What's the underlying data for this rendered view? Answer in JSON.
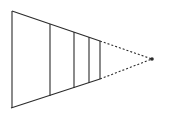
{
  "figure": {
    "kind": "perspective-line-drawing",
    "width": 169,
    "height": 115,
    "background_color": "#ffffff",
    "stroke_color": "#2b2b2b",
    "stroke_width": 1.1,
    "dash_pattern": "2,2"
  },
  "geometry": {
    "vanishing_point": {
      "x": 152,
      "y": 59,
      "dot_radius": 1.8
    },
    "top_edge": {
      "x1": 12,
      "y1": 11,
      "x2": 100,
      "y2": 41,
      "style": "solid"
    },
    "bottom_edge": {
      "x1": 11,
      "y1": 108,
      "x2": 100,
      "y2": 79,
      "style": "solid"
    },
    "top_edge_dashed": {
      "x1": 100,
      "y1": 41,
      "x2": 152,
      "y2": 59,
      "style": "dashed"
    },
    "bottom_edge_dashed": {
      "x1": 100,
      "y1": 79,
      "x2": 152,
      "y2": 59,
      "style": "dashed"
    },
    "verticals": [
      {
        "name": "front-face-edge",
        "x": 12,
        "y_top": 11,
        "y_bottom": 108,
        "style": "solid"
      },
      {
        "name": "rib-1",
        "x": 50,
        "y_top": 24,
        "y_bottom": 96,
        "style": "solid"
      },
      {
        "name": "rib-2",
        "x": 74,
        "y_top": 32,
        "y_bottom": 88,
        "style": "solid"
      },
      {
        "name": "rib-3",
        "x": 89,
        "y_top": 37,
        "y_bottom": 83,
        "style": "solid"
      },
      {
        "name": "rib-4",
        "x": 100,
        "y_top": 41,
        "y_bottom": 79,
        "style": "solid"
      }
    ]
  },
  "chart_data": {
    "type": "line",
    "title": "",
    "xlabel": "",
    "ylabel": "",
    "grid": false,
    "series": [
      {
        "name": "upper-convergent-edge",
        "x": [
          12,
          100,
          152
        ],
        "y": [
          11,
          41,
          59
        ]
      },
      {
        "name": "lower-convergent-edge",
        "x": [
          11,
          100,
          152
        ],
        "y": [
          108,
          79,
          59
        ]
      },
      {
        "name": "vertical-rib-heights",
        "x": [
          12,
          50,
          74,
          89,
          100
        ],
        "y": [
          97,
          72,
          56,
          46,
          38
        ]
      }
    ]
  }
}
